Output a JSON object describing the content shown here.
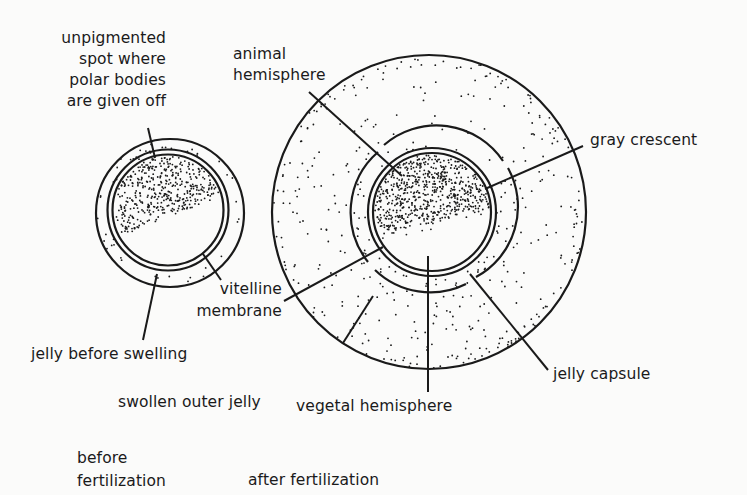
{
  "figure": {
    "colors": {
      "ink": "#1a1a1a",
      "background": "#fbfbfa"
    },
    "panels": [
      {
        "id": "before",
        "caption": "before\nfertilization",
        "structures": [
          "unpigmented spot",
          "pigmented animal region",
          "vitelline membrane",
          "jelly before swelling"
        ]
      },
      {
        "id": "after",
        "caption": "after fertilization",
        "structures": [
          "animal hemisphere",
          "gray crescent",
          "vegetal hemisphere",
          "vitelline membrane",
          "jelly capsule",
          "swollen outer jelly"
        ]
      }
    ]
  },
  "labels": {
    "unpigmented_spot": "unpigmented\nspot where\npolar bodies\nare given off",
    "animal_hemisphere": "animal\nhemisphere",
    "gray_crescent": "gray crescent",
    "vitelline_membrane": "vitelline\nmembrane",
    "jelly_before_swelling": "jelly before swelling",
    "jelly_capsule": "jelly capsule",
    "swollen_outer_jelly": "swollen outer jelly",
    "vegetal_hemisphere": "vegetal hemisphere",
    "caption_before": "before\nfertilization",
    "caption_after": "after fertilization"
  }
}
